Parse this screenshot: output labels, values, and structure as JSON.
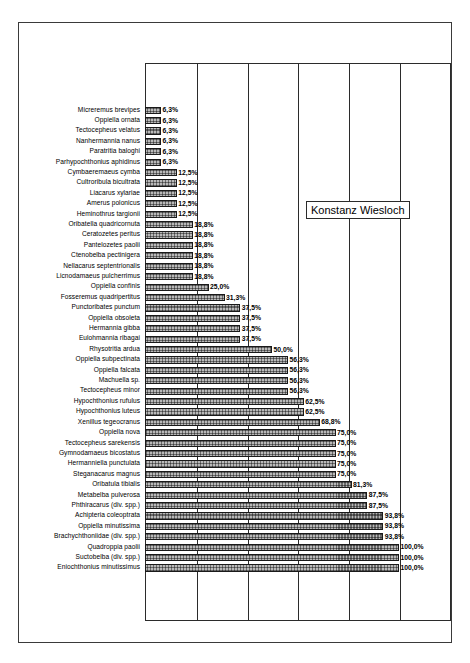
{
  "legend": {
    "text": "Konstanz Wiesloch"
  },
  "colors": {
    "frame": "#3a3a3a",
    "plot_border": "#2b2b2b",
    "gridline": "#2b2b2b",
    "bar_fill": "#b9b9b9",
    "bar_border": "#1a1a1a",
    "text": "#000000",
    "background": "#ffffff"
  },
  "chart_data": {
    "type": "bar",
    "orientation": "horizontal",
    "title": "",
    "subtitle": "",
    "xlabel": "",
    "ylabel": "",
    "xlim": [
      0,
      100
    ],
    "xunit": "%",
    "grid": true,
    "gridline_values": [
      0,
      20,
      40,
      60,
      80,
      100
    ],
    "legend": [
      "Konstanz Wiesloch"
    ],
    "legend_position": "inside-upper-right",
    "decimal_separator": ",",
    "categories": [
      "Micreremus brevipes",
      "Oppiella ornata",
      "Tectocepheus velatus",
      "Nanhermannia nanus",
      "Paratritia baloghi",
      "Parhypochthonius aphidinus",
      "Cymbaeremaeus cymba",
      "Cultroribula bicultrata",
      "Liacarus xylariae",
      "Amerus polonicus",
      "Heminothrus targionii",
      "Oribatella quadricornuta",
      "Ceratozetes peritus",
      "Pantelozetes paolii",
      "Ctenobelba pectinigera",
      "Nellacarus septentrionalis",
      "Licnodamaeus pulcherrimus",
      "Oppiella confinis",
      "Fosseremus quadripertitus",
      "Punctoribates punctum",
      "Oppiella obsoleta",
      "Hermannia gibba",
      "Eulohmannia ribagai",
      "Rhysotritia ardua",
      "Oppiella subpectinata",
      "Oppiella falcata",
      "Machuella sp.",
      "Tectocepheus minor",
      "Hypochthonius rufulus",
      "Hypochthonius luteus",
      "Xenillus tegeocranus",
      "Oppiella nova",
      "Tectocepheus sarekensis",
      "Gymnodamaeus bicostatus",
      "Hermanniella punctulata",
      "Steganacarus magnus",
      "Oribatula tibialis",
      "Metabelba pulverosa",
      "Phthiracarus (div. spp.)",
      "Achipteria coleoptrata",
      "Oppiella minutissima",
      "Brachychthoniidae (div. spp.)",
      "Quadroppia paolii",
      "Suctobelba (div. spp.)",
      "Eniochthonius minutissimus"
    ],
    "values": [
      6.3,
      6.3,
      6.3,
      6.3,
      6.3,
      6.3,
      12.5,
      12.5,
      12.5,
      12.5,
      12.5,
      18.8,
      18.8,
      18.8,
      18.8,
      18.8,
      18.8,
      25.0,
      31.3,
      37.5,
      37.5,
      37.5,
      37.5,
      50.0,
      56.3,
      56.3,
      56.3,
      56.3,
      62.5,
      62.5,
      68.8,
      75.0,
      75.0,
      75.0,
      75.0,
      75.0,
      81.3,
      87.5,
      87.5,
      93.8,
      93.8,
      93.8,
      100.0,
      100.0,
      100.0
    ],
    "value_labels": [
      "6,3%",
      "6,3%",
      "6,3%",
      "6,3%",
      "6,3%",
      "6,3%",
      "12,5%",
      "12,5%",
      "12,5%",
      "12,5%",
      "12,5%",
      "18,8%",
      "18,8%",
      "18,8%",
      "18,8%",
      "18,8%",
      "18,8%",
      "25,0%",
      "31,3%",
      "37,5%",
      "37,5%",
      "37,5%",
      "37,5%",
      "50,0%",
      "56,3%",
      "56,3%",
      "56,3%",
      "56,3%",
      "62,5%",
      "62,5%",
      "68,8%",
      "75,0%",
      "75,0%",
      "75,0%",
      "75,0%",
      "75,0%",
      "81,3%",
      "87,5%",
      "87,5%",
      "93,8%",
      "93,8%",
      "93,8%",
      "100,0%",
      "100,0%",
      "100,0%"
    ]
  }
}
